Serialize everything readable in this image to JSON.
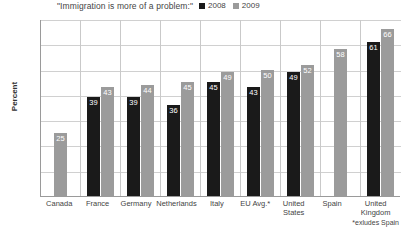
{
  "chart_data": {
    "type": "bar",
    "title": "\"Immigration is more of a problem:\"",
    "xlabel": "",
    "ylabel": "Percent",
    "ylim": [
      0,
      70
    ],
    "yticks": [
      0,
      10,
      20,
      30,
      40,
      50,
      60,
      70
    ],
    "grid": true,
    "legend_position": "top-right",
    "categories": [
      "Canada",
      "France",
      "Germany",
      "Netherlands",
      "Italy",
      "EU Avg.*",
      "United States",
      "Spain",
      "United Kingdom"
    ],
    "series": [
      {
        "name": "2008",
        "color": "#1a1a1a",
        "values": [
          null,
          39,
          39,
          36,
          45,
          43,
          49,
          null,
          61
        ]
      },
      {
        "name": "2009",
        "color": "#9b9b9b",
        "values": [
          25,
          43,
          44,
          45,
          49,
          50,
          52,
          58,
          66
        ]
      }
    ],
    "annotations": [
      "*exludes Spain"
    ]
  },
  "legend": {
    "items": [
      {
        "label": "2008",
        "color": "#1a1a1a"
      },
      {
        "label": "2009",
        "color": "#9b9b9b"
      }
    ]
  },
  "footnote": "*exludes Spain"
}
